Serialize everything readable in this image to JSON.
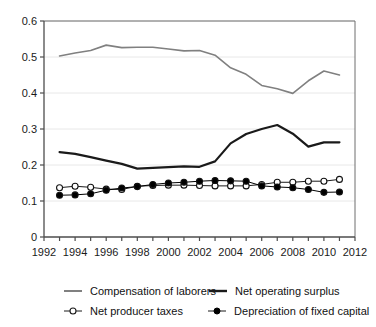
{
  "chart_data": {
    "type": "line",
    "title": "",
    "xlabel": "",
    "ylabel": "",
    "xlim": [
      1992,
      2012
    ],
    "ylim": [
      0,
      0.6
    ],
    "grid": true,
    "legend_position": "bottom",
    "x_ticks": [
      1992,
      1993,
      1994,
      1995,
      1996,
      1997,
      1998,
      1999,
      2000,
      2001,
      2002,
      2003,
      2004,
      2005,
      2006,
      2007,
      2008,
      2009,
      2010,
      2011,
      2012
    ],
    "x_tick_labels": [
      "1992",
      "",
      "1994",
      "",
      "1996",
      "",
      "1998",
      "",
      "2000",
      "",
      "2002",
      "",
      "2004",
      "",
      "2006",
      "",
      "2008",
      "",
      "2010",
      "",
      "2012"
    ],
    "y_ticks": [
      0,
      0.1,
      0.2,
      0.3,
      0.4,
      0.5,
      0.6
    ],
    "y_tick_labels": [
      "0",
      "0.1",
      "0.2",
      "0.3",
      "0.4",
      "0.5",
      "0.6"
    ],
    "x": [
      1993,
      1994,
      1995,
      1996,
      1997,
      1998,
      1999,
      2000,
      2001,
      2002,
      2003,
      2004,
      2005,
      2006,
      2007,
      2008,
      2009,
      2010,
      2011
    ],
    "series": [
      {
        "name": "Compensation of laborers",
        "marker": "none",
        "color": "#808080",
        "values": [
          0.503,
          0.511,
          0.518,
          0.533,
          0.526,
          0.527,
          0.527,
          0.522,
          0.517,
          0.518,
          0.505,
          0.47,
          0.452,
          0.421,
          0.412,
          0.399,
          0.434,
          0.461,
          0.45
        ]
      },
      {
        "name": "Net operating surplus",
        "marker": "none",
        "color": "#1a1a1a",
        "values": [
          0.236,
          0.231,
          0.222,
          0.212,
          0.203,
          0.19,
          0.192,
          0.194,
          0.196,
          0.195,
          0.21,
          0.26,
          0.286,
          0.3,
          0.311,
          0.287,
          0.251,
          0.263,
          0.263
        ]
      },
      {
        "name": "Net producer taxes",
        "marker": "open-circle",
        "color": "#1a1a1a",
        "values": [
          0.137,
          0.141,
          0.138,
          0.133,
          0.132,
          0.141,
          0.143,
          0.144,
          0.144,
          0.143,
          0.142,
          0.142,
          0.142,
          0.146,
          0.152,
          0.152,
          0.155,
          0.155,
          0.16
        ]
      },
      {
        "name": "Depreciation of fixed capital",
        "marker": "filled-circle",
        "color": "#000000",
        "values": [
          0.116,
          0.117,
          0.12,
          0.13,
          0.136,
          0.14,
          0.146,
          0.15,
          0.152,
          0.155,
          0.157,
          0.156,
          0.155,
          0.142,
          0.139,
          0.137,
          0.132,
          0.124,
          0.125
        ]
      }
    ]
  },
  "legend": {
    "items": [
      {
        "label": "Compensation of laborers",
        "key": "gray-line-key"
      },
      {
        "label": "Net operating surplus",
        "key": "black-line-key"
      },
      {
        "label": "Net producer taxes",
        "key": "open-circle-line-key"
      },
      {
        "label": "Depreciation of fixed capital",
        "key": "filled-circle-line-key"
      }
    ]
  }
}
